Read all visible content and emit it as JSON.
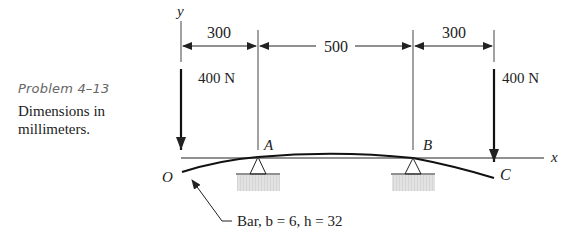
{
  "caption": {
    "problem_label": "Problem 4–13",
    "description_line1": "Dimensions in",
    "description_line2": "millimeters."
  },
  "axes": {
    "y_label": "y",
    "x_label": "x"
  },
  "dimensions": {
    "OA": "300",
    "AB": "500",
    "BC": "300",
    "units": "mm"
  },
  "loads": {
    "left": "400 N",
    "right": "400 N"
  },
  "points": {
    "O": "O",
    "A": "A",
    "B": "B",
    "C": "C"
  },
  "bar_note": "Bar, b = 6, h = 32",
  "colors": {
    "ink": "#222222",
    "ground": "#d9d9d9",
    "caption_gray": "#666666"
  }
}
